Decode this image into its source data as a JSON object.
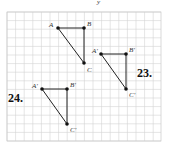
{
  "figure": {
    "grid": {
      "x0": 7,
      "y0": 12,
      "x1": 161,
      "y1": 141,
      "cell": 8.6,
      "color": "#d4d4d4"
    },
    "axis_label_top": "y",
    "problems": [
      {
        "number": "23.",
        "number_pos": [
          137,
          77
        ],
        "original": {
          "points": [
            {
              "name": "A",
              "x": 58,
              "y": 28,
              "lx": 49,
              "ly": 27
            },
            {
              "name": "B",
              "x": 84,
              "y": 28,
              "lx": 87,
              "ly": 26
            },
            {
              "name": "C",
              "x": 84,
              "y": 63,
              "lx": 87,
              "ly": 72
            }
          ]
        },
        "image": {
          "points": [
            {
              "name": "A′",
              "x": 101,
              "y": 54,
              "lx": 92,
              "ly": 53
            },
            {
              "name": "B′",
              "x": 126,
              "y": 54,
              "lx": 129,
              "ly": 52
            },
            {
              "name": "C′",
              "x": 126,
              "y": 89,
              "lx": 129,
              "ly": 97
            }
          ]
        }
      },
      {
        "number": "24.",
        "number_pos": [
          8,
          102
        ],
        "image": {
          "points": [
            {
              "name": "A′",
              "x": 42,
              "y": 89,
              "lx": 32,
              "ly": 88
            },
            {
              "name": "B′",
              "x": 67,
              "y": 89,
              "lx": 70,
              "ly": 87
            },
            {
              "name": "C′",
              "x": 67,
              "y": 124,
              "lx": 70,
              "ly": 132
            }
          ]
        }
      }
    ]
  }
}
